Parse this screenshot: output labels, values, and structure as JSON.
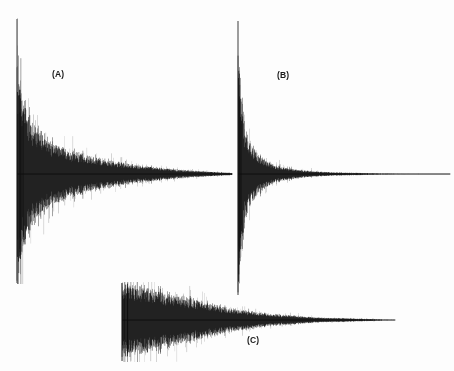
{
  "figure": {
    "width": 454,
    "height": 371,
    "background_color": "#fdfdfd",
    "trace_color": "#0d0d0d",
    "label_color": "#1a1a1a"
  },
  "chart_data": [
    {
      "type": "line",
      "name": "panel-a",
      "title": "(A)",
      "label": "(A)",
      "label_x": 52,
      "label_y": 69,
      "description": "Decaying oscillatory waveform (impulse response) with long reverberation tail",
      "xlabel": "",
      "ylabel": "",
      "grid": false,
      "legend": false,
      "plot_x": 14,
      "plot_y": 18,
      "plot_width": 220,
      "plot_height": 266,
      "baseline_y": 174,
      "onset_x": 17,
      "peak_amplitude": 1.0,
      "decay_constant": 0.052,
      "tail_end_x": 232,
      "envelope_x": [
        17,
        22,
        30,
        40,
        55,
        75,
        100,
        130,
        165,
        200,
        232
      ],
      "envelope_amplitude": [
        1.0,
        0.72,
        0.52,
        0.39,
        0.28,
        0.2,
        0.14,
        0.09,
        0.05,
        0.025,
        0.01
      ],
      "noise_density": 0.55
    },
    {
      "type": "line",
      "name": "panel-b",
      "title": "(B)",
      "label": "(B)",
      "label_x": 277,
      "label_y": 70,
      "description": "Decaying oscillatory waveform with short, rapid decay",
      "xlabel": "",
      "ylabel": "",
      "grid": false,
      "legend": false,
      "plot_x": 234,
      "plot_y": 20,
      "plot_width": 220,
      "plot_height": 276,
      "baseline_y": 174,
      "onset_x": 238,
      "peak_amplitude": 1.0,
      "decay_constant": 0.16,
      "tail_end_x": 450,
      "envelope_x": [
        238,
        241,
        245,
        250,
        258,
        268,
        280,
        300,
        330,
        380,
        450
      ],
      "envelope_amplitude": [
        1.0,
        0.6,
        0.38,
        0.26,
        0.16,
        0.1,
        0.06,
        0.03,
        0.014,
        0.006,
        0.002
      ],
      "noise_density": 0.5
    },
    {
      "type": "line",
      "name": "panel-c",
      "title": "(C)",
      "label": "(C)",
      "label_x": 247,
      "label_y": 335,
      "description": "Decaying oscillatory waveform with gradual onset and medium decay",
      "xlabel": "",
      "ylabel": "",
      "grid": false,
      "legend": false,
      "plot_x": 118,
      "plot_y": 282,
      "plot_width": 300,
      "plot_height": 80,
      "baseline_y": 320,
      "onset_x": 122,
      "peak_amplitude": 1.0,
      "decay_constant": 0.028,
      "tail_end_x": 395,
      "envelope_x": [
        122,
        126,
        133,
        145,
        160,
        180,
        205,
        235,
        270,
        320,
        395
      ],
      "envelope_amplitude": [
        0.82,
        1.0,
        0.95,
        0.88,
        0.78,
        0.64,
        0.46,
        0.29,
        0.16,
        0.06,
        0.01
      ],
      "noise_density": 0.62
    }
  ]
}
